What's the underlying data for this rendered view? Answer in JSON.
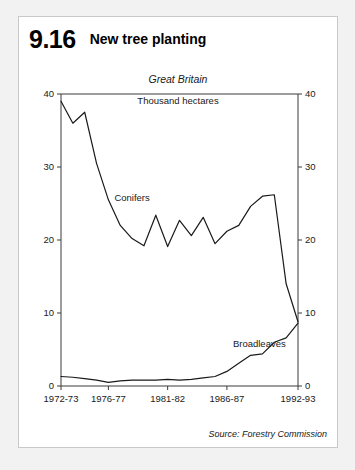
{
  "figure": {
    "number": "9.16",
    "title": "New tree planting",
    "region": "Great Britain",
    "unit": "Thousand hectares",
    "source": "Source: Forestry Commission"
  },
  "chart_data": {
    "type": "line",
    "title": "New tree planting",
    "subtitle": "Great Britain",
    "ylabel": "Thousand hectares",
    "xlabel": "",
    "ylim": [
      0,
      40
    ],
    "yticks": [
      0,
      10,
      20,
      30,
      40
    ],
    "ytick_labels": [
      "0",
      "10",
      "20",
      "30",
      "40"
    ],
    "ytick_labels_right": [
      "0",
      "10",
      "20",
      "30",
      "40"
    ],
    "xtick_labels": [
      "1972-73",
      "1976-77",
      "1981-82",
      "1986-87",
      "1992-93"
    ],
    "xtick_index": [
      0,
      4,
      9,
      14,
      20
    ],
    "x": [
      "1972-73",
      "1973-74",
      "1974-75",
      "1975-76",
      "1976-77",
      "1977-78",
      "1978-79",
      "1979-80",
      "1980-81",
      "1981-82",
      "1982-83",
      "1983-84",
      "1984-85",
      "1985-86",
      "1986-87",
      "1987-88",
      "1988-89",
      "1989-90",
      "1990-91",
      "1991-92",
      "1992-93"
    ],
    "grid": false,
    "legend": "inline-annotations",
    "series": [
      {
        "name": "Conifers",
        "values": [
          39.0,
          36.0,
          37.5,
          30.5,
          25.5,
          22.0,
          20.2,
          19.2,
          23.4,
          19.1,
          22.7,
          20.6,
          23.1,
          19.5,
          21.2,
          22.0,
          24.6,
          26.0,
          26.2,
          14.0,
          8.8
        ],
        "label_position": {
          "x": "1976-77",
          "y": 25.3
        }
      },
      {
        "name": "Broadleaves",
        "values": [
          1.3,
          1.2,
          1.0,
          0.8,
          0.5,
          0.7,
          0.8,
          0.8,
          0.8,
          0.9,
          0.8,
          0.9,
          1.1,
          1.3,
          2.0,
          3.1,
          4.2,
          4.4,
          6.0,
          6.6,
          8.6
        ],
        "label_position": {
          "x": "1986-87",
          "y": 5.4
        }
      }
    ]
  }
}
